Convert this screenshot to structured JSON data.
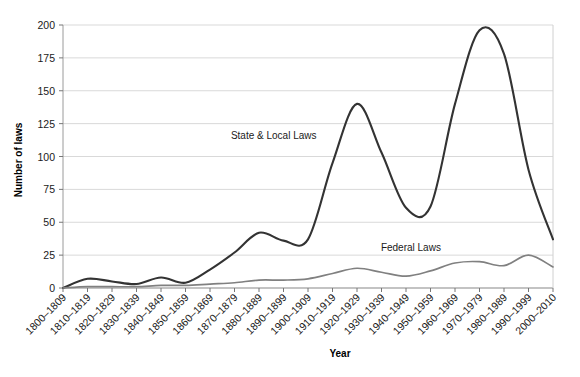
{
  "chart_data": {
    "type": "line",
    "title": "",
    "xlabel": "Year",
    "ylabel": "Number of laws",
    "ylim": [
      0,
      200
    ],
    "yticks": [
      0,
      25,
      50,
      75,
      100,
      125,
      150,
      175,
      200
    ],
    "grid": true,
    "legend_position": "inline-annotation",
    "categories": [
      "1800–1809",
      "1810–1819",
      "1820–1829",
      "1830–1839",
      "1840–1849",
      "1850–1859",
      "1860–1869",
      "1870–1879",
      "1880–1889",
      "1890–1899",
      "1900–1909",
      "1910–1919",
      "1920–1929",
      "1930–1939",
      "1940–1949",
      "1950–1959",
      "1960–1969",
      "1970–1979",
      "1980–1989",
      "1990–1999",
      "2000–2010"
    ],
    "series": [
      {
        "name": "State & Local Laws",
        "color": "#333333",
        "values": [
          0,
          7,
          5,
          3,
          8,
          4,
          14,
          27,
          42,
          36,
          37,
          95,
          140,
          103,
          61,
          62,
          140,
          196,
          178,
          90,
          37
        ]
      },
      {
        "name": "Federal Laws",
        "color": "#808080",
        "values": [
          0,
          1,
          1,
          1,
          2,
          2,
          3,
          4,
          6,
          6,
          7,
          11,
          15,
          12,
          9,
          13,
          19,
          20,
          17,
          25,
          16
        ]
      }
    ],
    "annotations": [
      {
        "text": "State & Local Laws",
        "x_index": 8.6,
        "y_value": 113
      },
      {
        "text": "Federal Laws",
        "x_index": 14.2,
        "y_value": 28
      }
    ]
  }
}
